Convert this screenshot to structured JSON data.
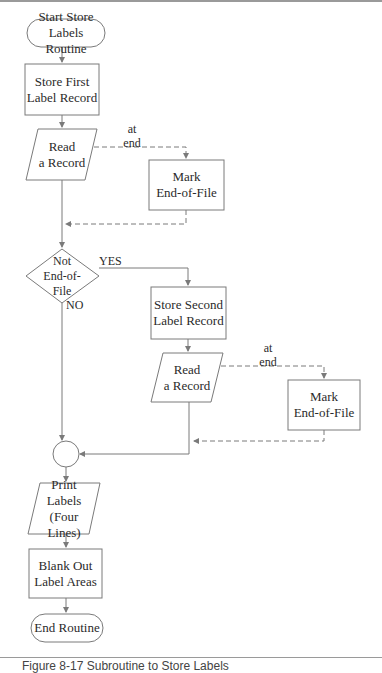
{
  "diagram": {
    "type": "flowchart",
    "nodes": {
      "start": {
        "shape": "terminal",
        "line1": "Start Store",
        "line2": "Labels Routine"
      },
      "store_first": {
        "shape": "process",
        "line1": "Store First",
        "line2": "Label Record"
      },
      "read1": {
        "shape": "io",
        "line1": "Read",
        "line2": "a Record"
      },
      "mark1": {
        "shape": "process",
        "line1": "Mark",
        "line2": "End-of-File"
      },
      "decision": {
        "shape": "decision",
        "line1": "Not",
        "line2": "End-of-",
        "line3": "File"
      },
      "store_second": {
        "shape": "process",
        "line1": "Store Second",
        "line2": "Label Record"
      },
      "read2": {
        "shape": "io",
        "line1": "Read",
        "line2": "a Record"
      },
      "mark2": {
        "shape": "process",
        "line1": "Mark",
        "line2": "End-of-File"
      },
      "connector": {
        "shape": "connector"
      },
      "print": {
        "shape": "io",
        "line1": "Print",
        "line2": "Labels",
        "line3": "(Four Lines)"
      },
      "blank": {
        "shape": "process",
        "line1": "Blank Out",
        "line2": "Label Areas"
      },
      "end": {
        "shape": "terminal",
        "line1": "End Routine"
      }
    },
    "edge_labels": {
      "at_end_1": {
        "line1": "at",
        "line2": "end"
      },
      "at_end_2": {
        "line1": "at",
        "line2": "end"
      },
      "yes": "YES",
      "no": "NO"
    },
    "edges": [
      {
        "from": "start",
        "to": "store_first",
        "style": "solid"
      },
      {
        "from": "store_first",
        "to": "read1",
        "style": "solid"
      },
      {
        "from": "read1",
        "to": "mark1",
        "style": "dashed",
        "label": "at end"
      },
      {
        "from": "mark1",
        "to": "read1-exit",
        "style": "dashed"
      },
      {
        "from": "read1",
        "to": "decision",
        "style": "solid"
      },
      {
        "from": "decision",
        "to": "store_second",
        "style": "solid",
        "label": "YES"
      },
      {
        "from": "decision",
        "to": "connector",
        "style": "solid",
        "label": "NO"
      },
      {
        "from": "store_second",
        "to": "read2",
        "style": "solid"
      },
      {
        "from": "read2",
        "to": "mark2",
        "style": "dashed",
        "label": "at end"
      },
      {
        "from": "mark2",
        "to": "read2-exit",
        "style": "dashed"
      },
      {
        "from": "read2",
        "to": "connector",
        "style": "solid"
      },
      {
        "from": "connector",
        "to": "print",
        "style": "solid"
      },
      {
        "from": "print",
        "to": "blank",
        "style": "solid"
      },
      {
        "from": "blank",
        "to": "end",
        "style": "solid"
      }
    ]
  },
  "caption": "Figure 8-17  Subroutine to Store Labels"
}
